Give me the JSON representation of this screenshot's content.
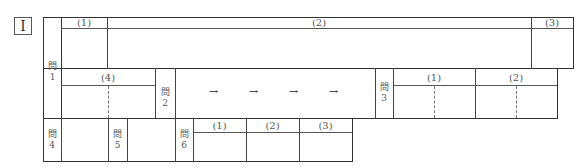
{
  "section": {
    "roman_numeral": "I"
  },
  "questions": {
    "q1": {
      "label_kanji": "問",
      "label_num": "1",
      "parts": [
        "(1)",
        "(2)",
        "(3)",
        "(4)"
      ]
    },
    "q2": {
      "label_kanji": "問",
      "label_num": "2",
      "arrows": [
        "→",
        "→",
        "→",
        "→"
      ]
    },
    "q3": {
      "label_kanji": "問",
      "label_num": "3",
      "parts": [
        "(1)",
        "(2)"
      ]
    },
    "q4": {
      "label_kanji": "問",
      "label_num": "4"
    },
    "q5": {
      "label_kanji": "問",
      "label_num": "5"
    },
    "q6": {
      "label_kanji": "問",
      "label_num": "6",
      "parts": [
        "(1)",
        "(2)",
        "(3)"
      ]
    }
  }
}
